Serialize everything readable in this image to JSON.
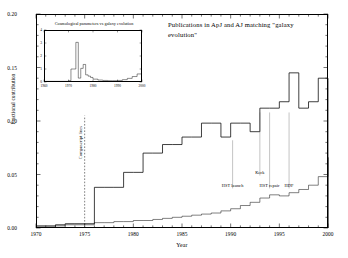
{
  "chart_data": {
    "type": "line",
    "title": "Publications in ApJ and AJ matching \"galaxy evolution\"",
    "xlabel": "Year",
    "ylabel": "Fractional contribution",
    "xlim": [
      1970,
      2000
    ],
    "ylim": [
      0.0,
      0.2
    ],
    "xticks": [
      1970,
      1975,
      1980,
      1985,
      1990,
      1995,
      2000
    ],
    "xticklabels": [
      "1970",
      "1975",
      "1980",
      "1985",
      "1990",
      "1995",
      "2000"
    ],
    "yticks": [
      0.0,
      0.05,
      0.1,
      0.15,
      0.2
    ],
    "yticklabels": [
      "0.00",
      "0.05",
      "0.10",
      "0.15",
      "0.20"
    ],
    "grid": false,
    "legend": "none",
    "series": [
      {
        "name": "galaxy evolution (primary)",
        "style": "step",
        "x": [
          1970,
          1971,
          1972,
          1973,
          1974,
          1975,
          1976,
          1977,
          1978,
          1979,
          1980,
          1981,
          1982,
          1983,
          1984,
          1985,
          1986,
          1987,
          1988,
          1989,
          1990,
          1991,
          1992,
          1993,
          1994,
          1995,
          1996,
          1997,
          1998,
          1999,
          2000
        ],
        "values": [
          0.002,
          0.002,
          0.003,
          0.004,
          0.004,
          0.004,
          0.038,
          0.038,
          0.038,
          0.052,
          0.052,
          0.07,
          0.07,
          0.078,
          0.078,
          0.085,
          0.085,
          0.098,
          0.098,
          0.085,
          0.098,
          0.098,
          0.09,
          0.112,
          0.112,
          0.118,
          0.145,
          0.112,
          0.118,
          0.14,
          0.138
        ]
      },
      {
        "name": "galaxy evolution (secondary)",
        "style": "step",
        "x": [
          1970,
          1971,
          1972,
          1973,
          1974,
          1975,
          1976,
          1977,
          1978,
          1979,
          1980,
          1981,
          1982,
          1983,
          1984,
          1985,
          1986,
          1987,
          1988,
          1989,
          1990,
          1991,
          1992,
          1993,
          1994,
          1995,
          1996,
          1997,
          1998,
          1999,
          2000
        ],
        "values": [
          0.001,
          0.001,
          0.002,
          0.003,
          0.003,
          0.003,
          0.005,
          0.005,
          0.006,
          0.006,
          0.007,
          0.007,
          0.008,
          0.009,
          0.01,
          0.011,
          0.012,
          0.013,
          0.014,
          0.016,
          0.018,
          0.021,
          0.024,
          0.028,
          0.031,
          0.03,
          0.033,
          0.036,
          0.04,
          0.048,
          0.066
        ]
      }
    ],
    "reference_line": {
      "x": 1975,
      "style": "dashed",
      "label": "Compuscript lines"
    },
    "annotations": [
      {
        "label": "HST launch",
        "x": 1990.2,
        "label_y": 0.04,
        "leader_top": 0.082
      },
      {
        "label": "Keck",
        "x": 1993.0,
        "label_y": 0.052,
        "leader_top": 0.108
      },
      {
        "label": "HST repair",
        "x": 1994.0,
        "label_y": 0.04,
        "leader_top": 0.108
      },
      {
        "label": "HDF",
        "x": 1996.0,
        "label_y": 0.04,
        "leader_top": 0.108
      }
    ]
  },
  "inset": {
    "title": "Cosmological parameters vs galaxy evolution",
    "xlim": [
      1960,
      2000
    ],
    "ylim": [
      0,
      4
    ],
    "xticks": [
      1960,
      1970,
      1980,
      1990,
      2000
    ],
    "xticklabels": [
      "1960",
      "1970",
      "1980",
      "1990",
      "2000"
    ],
    "yticks": [
      0,
      1,
      2,
      3,
      4
    ],
    "yticklabels": [
      "0",
      "1",
      "2",
      "3",
      "4"
    ],
    "series": {
      "name": "cosmological parameters",
      "style": "step",
      "x": [
        1960,
        1962,
        1964,
        1966,
        1968,
        1970,
        1971,
        1972,
        1973,
        1974,
        1975,
        1976,
        1977,
        1978,
        1979,
        1980,
        1982,
        1984,
        1986,
        1988,
        1990,
        1992,
        1994,
        1996,
        1998,
        2000
      ],
      "values": [
        0.05,
        0.05,
        0.05,
        0.05,
        0.05,
        0.1,
        1.0,
        1.0,
        3.05,
        0.3,
        1.05,
        1.35,
        0.55,
        0.45,
        0.35,
        0.22,
        0.15,
        0.12,
        0.1,
        0.1,
        0.12,
        0.18,
        0.28,
        0.42,
        0.62,
        0.95
      ]
    }
  }
}
